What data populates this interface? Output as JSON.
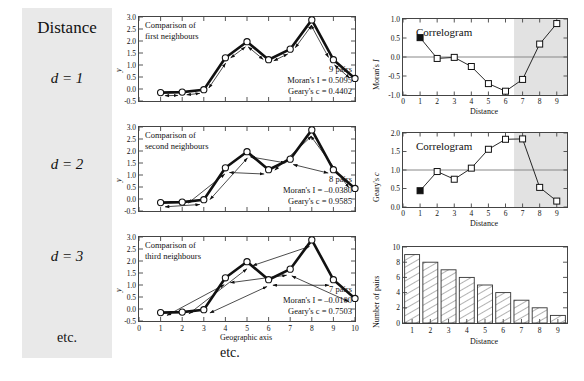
{
  "left_column": {
    "title": "Distance",
    "rows": [
      "d = 1",
      "d = 2",
      "d = 3"
    ],
    "etc": "etc."
  },
  "center_etc": "etc.",
  "scatter_panels": [
    {
      "caption_line1": "Comparison of",
      "caption_line2": "first neighbours",
      "pairs": "9 pairs",
      "moran": "Moran's I = 0.5095",
      "geary": "Geary's c = 0.4402",
      "lag": 1
    },
    {
      "caption_line1": "Comparison of",
      "caption_line2": "second neighbours",
      "pairs": "8 pairs",
      "moran": "Moran's I = –0.0380",
      "geary": "Geary's c =   0.9585",
      "lag": 2
    },
    {
      "caption_line1": "Comparison of",
      "caption_line2": "third neighbours",
      "pairs": "7 pairs",
      "moran": "Moran's I = –0.0100",
      "geary": "Geary's c =   0.7503",
      "lag": 3
    }
  ],
  "correlogram_title": "Correlogram",
  "chart_data": [
    {
      "type": "line",
      "title": "Comparison of first neighbours",
      "xlabel": "Geographic axis",
      "ylabel": "y",
      "xlim": [
        0,
        10
      ],
      "ylim": [
        -0.5,
        3.0
      ],
      "xticks": [
        0,
        1,
        2,
        3,
        4,
        5,
        6,
        7,
        8,
        9,
        10
      ],
      "yticks": [
        -0.5,
        0.0,
        0.5,
        1.0,
        1.5,
        2.0,
        2.5,
        3.0
      ],
      "x": [
        1,
        2,
        3,
        4,
        5,
        6,
        7,
        8,
        9,
        10
      ],
      "values": [
        -0.15,
        -0.13,
        -0.03,
        1.3,
        1.97,
        1.22,
        1.66,
        2.88,
        1.22,
        0.44
      ],
      "lag": 1,
      "grid": false,
      "legend": "none"
    },
    {
      "type": "line",
      "title": "Comparison of second neighbours",
      "xlabel": "Geographic axis",
      "ylabel": "y",
      "xlim": [
        0,
        10
      ],
      "ylim": [
        -0.5,
        3.0
      ],
      "xticks": [
        0,
        1,
        2,
        3,
        4,
        5,
        6,
        7,
        8,
        9,
        10
      ],
      "yticks": [
        -0.5,
        0.0,
        0.5,
        1.0,
        1.5,
        2.0,
        2.5,
        3.0
      ],
      "x": [
        1,
        2,
        3,
        4,
        5,
        6,
        7,
        8,
        9,
        10
      ],
      "values": [
        -0.15,
        -0.13,
        -0.03,
        1.3,
        1.97,
        1.22,
        1.66,
        2.88,
        1.22,
        0.44
      ],
      "lag": 2,
      "grid": false,
      "legend": "none"
    },
    {
      "type": "line",
      "title": "Comparison of third neighbours",
      "xlabel": "Geographic axis",
      "ylabel": "y",
      "xlim": [
        0,
        10
      ],
      "ylim": [
        -0.5,
        3.0
      ],
      "xticks": [
        0,
        1,
        2,
        3,
        4,
        5,
        6,
        7,
        8,
        9,
        10
      ],
      "yticks": [
        -0.5,
        0.0,
        0.5,
        1.0,
        1.5,
        2.0,
        2.5,
        3.0
      ],
      "x": [
        1,
        2,
        3,
        4,
        5,
        6,
        7,
        8,
        9,
        10
      ],
      "values": [
        -0.15,
        -0.13,
        -0.03,
        1.3,
        1.97,
        1.22,
        1.66,
        2.88,
        1.22,
        0.44
      ],
      "lag": 3,
      "grid": false,
      "legend": "none"
    },
    {
      "type": "line",
      "title": "Correlogram",
      "xlabel": "Distance",
      "ylabel": "Moran's I",
      "xlim": [
        0,
        9.6
      ],
      "ylim": [
        -1.0,
        1.0
      ],
      "xticks": [
        0,
        1,
        2,
        3,
        4,
        5,
        6,
        7,
        8,
        9
      ],
      "yticks": [
        -1.0,
        -0.5,
        0.0,
        0.5,
        1.0
      ],
      "x": [
        1,
        2,
        3,
        4,
        5,
        6,
        7,
        8,
        9
      ],
      "values": [
        0.5095,
        -0.038,
        -0.01,
        -0.25,
        -0.7,
        -0.9,
        -0.59,
        0.34,
        0.88
      ],
      "filled_points": [
        1
      ],
      "reference_line": 0.0,
      "shaded_from": 6.5,
      "grid": false,
      "legend": "none"
    },
    {
      "type": "line",
      "title": "Correlogram",
      "xlabel": "Distance",
      "ylabel": "Geary's c",
      "xlim": [
        0,
        9.6
      ],
      "ylim": [
        0.0,
        2.0
      ],
      "xticks": [
        0,
        1,
        2,
        3,
        4,
        5,
        6,
        7,
        8,
        9
      ],
      "yticks": [
        0.0,
        0.5,
        1.0,
        1.5,
        2.0
      ],
      "x": [
        1,
        2,
        3,
        4,
        5,
        6,
        7,
        8,
        9
      ],
      "values": [
        0.4402,
        0.9585,
        0.7503,
        1.05,
        1.56,
        1.83,
        1.84,
        0.53,
        0.16
      ],
      "filled_points": [
        1
      ],
      "reference_line": 1.0,
      "shaded_from": 6.5,
      "grid": false,
      "legend": "none"
    },
    {
      "type": "bar",
      "title": "",
      "xlabel": "Distance",
      "ylabel": "Number of pairs",
      "xlim": [
        0.5,
        9.5
      ],
      "ylim": [
        0,
        10
      ],
      "categories": [
        "1",
        "2",
        "3",
        "4",
        "5",
        "6",
        "7",
        "8",
        "9"
      ],
      "yticks": [
        0,
        2,
        4,
        6,
        8,
        10
      ],
      "values": [
        9,
        8,
        7,
        6,
        5,
        4,
        3,
        2,
        1
      ],
      "grid": false,
      "legend": "none"
    }
  ]
}
